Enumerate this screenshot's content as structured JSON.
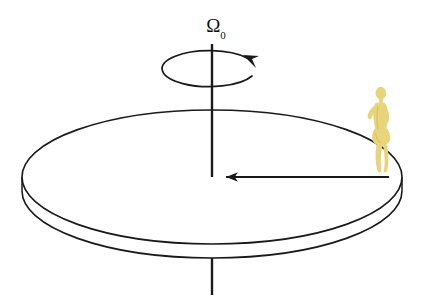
{
  "diagram": {
    "background_color": "#ffffff",
    "line_color": "#1a1a1a",
    "person_color": "#e8d47a",
    "person_color_dark": "#d9c05c",
    "labels": {
      "angular_velocity": "Ω",
      "angular_velocity_subscript": "0"
    },
    "elements": {
      "rotation_axis_name": "rotation-axis",
      "disk_name": "turntable-disk",
      "radius_arrow_name": "radius-arrow",
      "spin_arrow_name": "spin-direction-arrow",
      "person_name": "person-on-rim"
    },
    "geometry": {
      "disk_center_x": 212,
      "disk_center_y": 177,
      "disk_radius_x": 190,
      "disk_radius_y": 67,
      "disk_thickness": 14,
      "axis_top_y": 44,
      "axis_bottom_y": 295,
      "spin_ellipse_rx": 47,
      "spin_ellipse_ry": 18,
      "spin_ellipse_cy": 68,
      "radius_arrow_x_start": 389,
      "radius_arrow_x_end": 215,
      "radius_arrow_y": 177,
      "person_x": 378,
      "person_y": 132
    }
  }
}
